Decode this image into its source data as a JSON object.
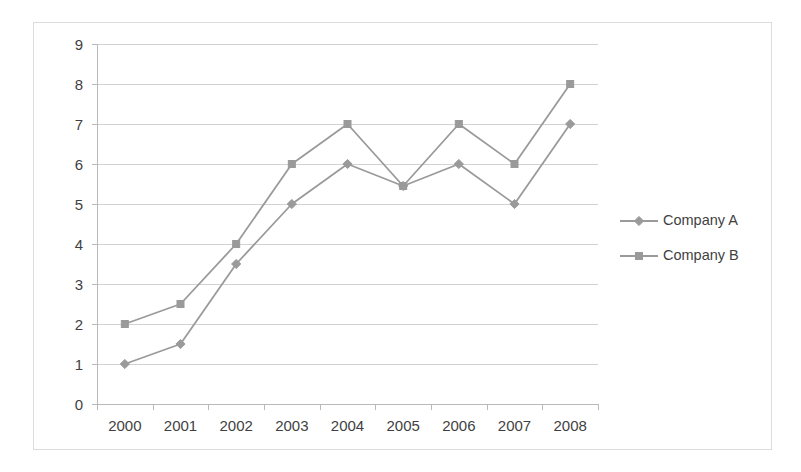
{
  "chart_data": {
    "type": "line",
    "title": "",
    "subtitle": "",
    "xlabel": "",
    "ylabel": "",
    "categories": [
      "2000",
      "2001",
      "2002",
      "2003",
      "2004",
      "2005",
      "2006",
      "2007",
      "2008"
    ],
    "series": [
      {
        "name": "Company A",
        "marker": "diamond",
        "color": "#9a9a9a",
        "values": [
          1,
          1.5,
          3.5,
          5,
          6,
          5.45,
          6,
          5,
          7
        ]
      },
      {
        "name": "Company B",
        "marker": "square",
        "color": "#9a9a9a",
        "values": [
          2,
          2.5,
          4,
          6,
          7,
          5.45,
          7,
          6,
          8
        ]
      }
    ],
    "ylim": [
      0,
      9
    ],
    "ytick_labels": [
      "0",
      "1",
      "2",
      "3",
      "4",
      "5",
      "6",
      "7",
      "8",
      "9"
    ],
    "grid": true,
    "grid_axis": "y",
    "legend_position": "right",
    "colors": {
      "series": "#9a9a9a",
      "gridline": "#d2d2d2",
      "axis": "#b9b9b9",
      "text": "#3f3f3f",
      "frame": "#dcdcdc",
      "background": "#ffffff"
    }
  }
}
